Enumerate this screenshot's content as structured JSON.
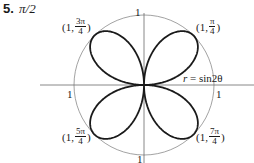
{
  "problem": {
    "number": "5.",
    "angle": "π/2"
  },
  "axis_labels": {
    "top": "1",
    "left": "1",
    "right": "1",
    "bottom": "1"
  },
  "equation": {
    "lhs": "r",
    "eq": " = ",
    "rhs": "sin2θ"
  },
  "points": [
    {
      "id": "pi-over-4",
      "prefix": "(1, ",
      "num": "π",
      "den": "4",
      "suffix": ")"
    },
    {
      "id": "3pi-over-4",
      "prefix": "(1, ",
      "num": "3π",
      "den": "4",
      "suffix": ")"
    },
    {
      "id": "5pi-over-4",
      "prefix": "(1, ",
      "num": "5π",
      "den": "4",
      "suffix": ")"
    },
    {
      "id": "7pi-over-4",
      "prefix": "(1, ",
      "num": "7π",
      "den": "4",
      "suffix": ")"
    }
  ],
  "colors": {
    "curve": "#1a1a1a",
    "circle": "#8a8a8a",
    "axes": "#6a6a6a"
  }
}
